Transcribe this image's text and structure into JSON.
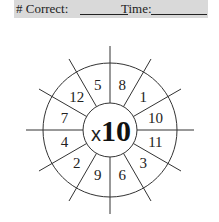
{
  "header": {
    "correct_label": "# Correct:",
    "time_label": "Time:"
  },
  "wheel": {
    "operator": "x",
    "multiplier": "10",
    "numbers": [
      "8",
      "1",
      "10",
      "11",
      "3",
      "6",
      "9",
      "2",
      "4",
      "7",
      "12",
      "5"
    ]
  }
}
